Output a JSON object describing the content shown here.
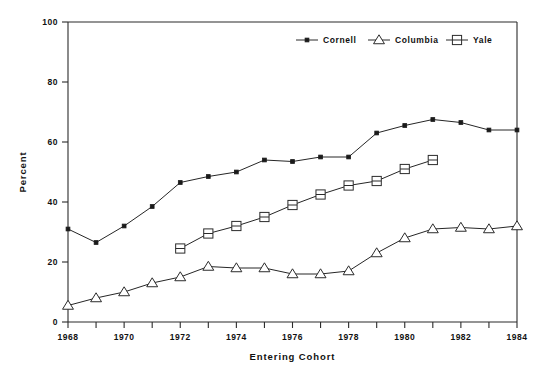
{
  "chart_data": {
    "type": "line",
    "title": "",
    "xlabel": "Entering Cohort",
    "ylabel": "Percent",
    "xlim": [
      1968,
      1984
    ],
    "ylim": [
      0,
      100
    ],
    "ytick_values": [
      0,
      20,
      40,
      60,
      80,
      100
    ],
    "ytick_labels": [
      "0",
      "20",
      "40",
      "60",
      "80",
      "100"
    ],
    "xtick_values": [
      1968,
      1969,
      1970,
      1971,
      1972,
      1973,
      1974,
      1975,
      1976,
      1977,
      1978,
      1979,
      1980,
      1981,
      1982,
      1983,
      1984
    ],
    "xtick_labels": [
      "1968",
      "",
      "1970",
      "",
      "1972",
      "",
      "1974",
      "",
      "1976",
      "",
      "1978",
      "",
      "1980",
      "",
      "1982",
      "",
      "1984"
    ],
    "grid": false,
    "legend_position": "top-center",
    "series": [
      {
        "name": "Cornell",
        "marker": "filled-circle",
        "x": [
          1968,
          1969,
          1970,
          1971,
          1972,
          1973,
          1974,
          1975,
          1976,
          1977,
          1978,
          1979,
          1980,
          1981,
          1982,
          1983,
          1984
        ],
        "values": [
          31,
          26.5,
          32,
          38.5,
          46.5,
          48.5,
          50,
          54,
          53.5,
          55,
          55,
          63,
          65.5,
          67.5,
          66.5,
          64,
          64
        ]
      },
      {
        "name": "Columbia",
        "marker": "open-triangle",
        "x": [
          1968,
          1969,
          1970,
          1971,
          1972,
          1973,
          1974,
          1975,
          1976,
          1977,
          1978,
          1979,
          1980,
          1981,
          1982,
          1983,
          1984
        ],
        "values": [
          5.5,
          8,
          10,
          13,
          15,
          18.5,
          18,
          18,
          16,
          16,
          17,
          23,
          28,
          31,
          31.5,
          31,
          32
        ]
      },
      {
        "name": "Yale",
        "marker": "open-square",
        "x": [
          1972,
          1973,
          1974,
          1975,
          1976,
          1977,
          1978,
          1979,
          1980,
          1981
        ],
        "values": [
          24.5,
          29.5,
          32,
          35,
          39,
          42.5,
          45.5,
          47,
          51,
          54
        ]
      }
    ]
  },
  "legend": {
    "entries": [
      {
        "label": "Cornell",
        "marker": "filled-circle"
      },
      {
        "label": "Columbia",
        "marker": "open-triangle"
      },
      {
        "label": "Yale",
        "marker": "open-square"
      }
    ]
  },
  "colors": {
    "ink": "#2b2b2b",
    "background": "#ffffff",
    "marker_fill": "#ffffff",
    "dot_fill": "#1a1a1a"
  }
}
